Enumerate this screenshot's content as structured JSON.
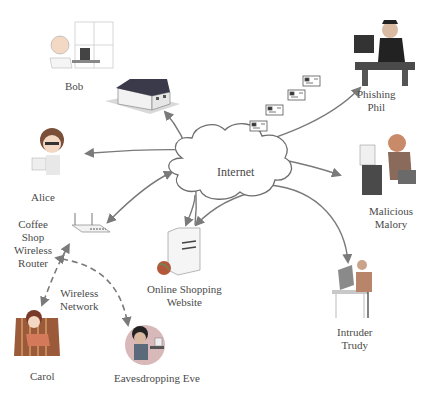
{
  "diagram": {
    "center": {
      "label": "Internet"
    },
    "nodes": [
      {
        "id": "bob",
        "lines": [
          "Bob"
        ]
      },
      {
        "id": "alice",
        "lines": [
          "Alice"
        ]
      },
      {
        "id": "router",
        "lines": [
          "Coffee",
          "Shop",
          "Wireless",
          "Router"
        ]
      },
      {
        "id": "carol",
        "lines": [
          "Carol"
        ]
      },
      {
        "id": "eve",
        "lines": [
          "Eavesdropping Eve"
        ]
      },
      {
        "id": "shop",
        "lines": [
          "Online Shopping",
          "Website"
        ]
      },
      {
        "id": "trudy",
        "lines": [
          "Intruder",
          "Trudy"
        ]
      },
      {
        "id": "malory",
        "lines": [
          "Malicious",
          "Malory"
        ]
      },
      {
        "id": "phil",
        "lines": [
          "Phishing",
          "Phil"
        ]
      }
    ],
    "wireless_label": [
      "Wireless",
      "Network"
    ],
    "colors": {
      "arrow": "#7a7a7a",
      "cloud_stroke": "#6e6e6e",
      "text": "#4a4a4a"
    }
  }
}
